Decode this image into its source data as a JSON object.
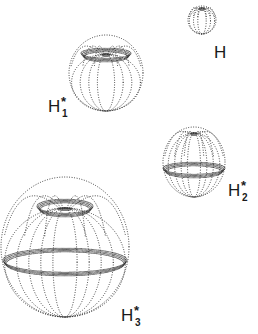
{
  "figure": {
    "ink_color": "#2a2a2a",
    "background": "#ffffff",
    "shapes": [
      {
        "id": "H",
        "label": "H",
        "superscript": "",
        "subscript": "",
        "cx": 202,
        "cy": 20,
        "rx": 14,
        "ry": 14,
        "bands": [],
        "meridians": 6,
        "pole_cluster_y": 8,
        "label_x": 214,
        "label_y": 44
      },
      {
        "id": "H1",
        "label": "H",
        "superscript": "*",
        "subscript": "1",
        "cx": 106,
        "cy": 73,
        "rx": 37,
        "ry": 38,
        "bands": [
          {
            "y": 55,
            "rx": 25,
            "ry": 5
          }
        ],
        "meridians": 8,
        "pole_cluster_y": 54,
        "label_x": 48,
        "label_y": 98
      },
      {
        "id": "H2",
        "label": "H",
        "superscript": "*",
        "subscript": "2",
        "cx": 194,
        "cy": 162,
        "rx": 31,
        "ry": 35,
        "bands": [
          {
            "y": 170,
            "rx": 31,
            "ry": 6
          }
        ],
        "meridians": 9,
        "pole_cluster_y": 133,
        "label_x": 228,
        "label_y": 182
      },
      {
        "id": "H3",
        "label": "H",
        "superscript": "*",
        "subscript": "3",
        "cx": 65,
        "cy": 247,
        "rx": 64,
        "ry": 70,
        "bands": [
          {
            "y": 208,
            "rx": 28,
            "ry": 7
          },
          {
            "y": 262,
            "rx": 62,
            "ry": 12
          }
        ],
        "meridians": 10,
        "pole_cluster_y": 208,
        "label_x": 121,
        "label_y": 307
      }
    ]
  }
}
